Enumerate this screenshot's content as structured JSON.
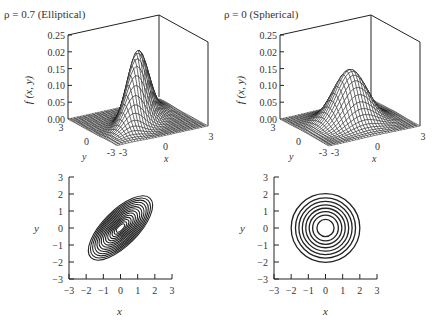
{
  "panels": {
    "tl": {
      "title": "ρ = 0.7 (Elliptical)",
      "zlabel": "f (x, y)",
      "xlabel": "x",
      "ylabel": "y"
    },
    "tr": {
      "title": "ρ = 0 (Spherical)",
      "zlabel": "f (x, y)",
      "xlabel": "x",
      "ylabel": "y"
    },
    "bl": {
      "xlabel": "x",
      "ylabel": "y"
    },
    "br": {
      "xlabel": "x",
      "ylabel": "y"
    }
  },
  "z_ticks": [
    "0.25",
    "0.02",
    "0.15",
    "0.10",
    "0.05",
    "0.00"
  ],
  "floor_ticks": {
    "y_back": "3",
    "y_mid": "0",
    "y_front": "-3",
    "x_front": "-3",
    "x_mid": "0",
    "x_right": "3"
  },
  "contour_ticks": [
    "-3",
    "-2",
    "-1",
    "0",
    "1",
    "2",
    "3"
  ],
  "colors": {
    "line": "#222222",
    "text": "#333333"
  },
  "chart_data": [
    {
      "type": "surface",
      "title": "ρ = 0.7 (Elliptical)",
      "zlabel": "f (x, y)",
      "xlabel": "x",
      "ylabel": "y",
      "x_range": [
        -3,
        3
      ],
      "y_range": [
        -3,
        3
      ],
      "z_range": [
        0,
        0.25
      ],
      "z_ticks": [
        0.0,
        0.05,
        0.1,
        0.15,
        0.02,
        0.25
      ],
      "rho": 0.7,
      "peak": 0.22
    },
    {
      "type": "surface",
      "title": "ρ = 0 (Spherical)",
      "zlabel": "f (x, y)",
      "xlabel": "x",
      "ylabel": "y",
      "x_range": [
        -3,
        3
      ],
      "y_range": [
        -3,
        3
      ],
      "z_range": [
        0,
        0.25
      ],
      "z_ticks": [
        0.0,
        0.05,
        0.1,
        0.15,
        0.02,
        0.25
      ],
      "rho": 0,
      "peak": 0.16
    },
    {
      "type": "contour",
      "xlabel": "x",
      "ylabel": "y",
      "xlim": [
        -3,
        3
      ],
      "ylim": [
        -3,
        3
      ],
      "x_ticks": [
        -3,
        -2,
        -1,
        0,
        1,
        2,
        3
      ],
      "y_ticks": [
        -3,
        -2,
        -1,
        0,
        1,
        2,
        3
      ],
      "rho": 0.7,
      "levels": 14,
      "orientation_deg": 45
    },
    {
      "type": "contour",
      "xlabel": "x",
      "ylabel": "y",
      "xlim": [
        -3,
        3
      ],
      "ylim": [
        -3,
        3
      ],
      "x_ticks": [
        -3,
        -2,
        -1,
        0,
        1,
        2,
        3
      ],
      "y_ticks": [
        -3,
        -2,
        -1,
        0,
        1,
        2,
        3
      ],
      "rho": 0,
      "levels": 8,
      "radii": [
        0.5,
        0.75,
        0.95,
        1.15,
        1.35,
        1.55,
        1.75,
        2.0
      ]
    }
  ]
}
